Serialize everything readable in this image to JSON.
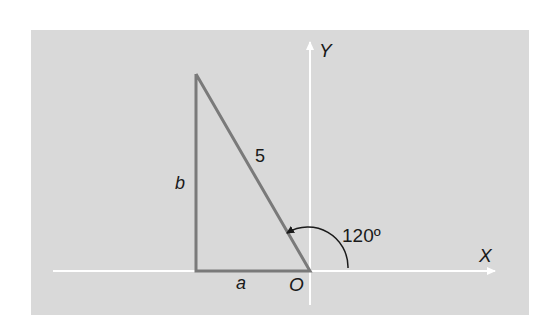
{
  "diagram": {
    "type": "right-triangle-on-axes",
    "colors": {
      "panel": "#d9d9d9",
      "axes": "#ffffff",
      "triangle": "#7a7a7a",
      "text": "#1a1a1a"
    },
    "axes": {
      "x_label": "X",
      "y_label": "Y",
      "origin_label": "O"
    },
    "triangle": {
      "hypotenuse_label": "5",
      "vertical_side_label": "b",
      "horizontal_side_label": "a"
    },
    "angle": {
      "label": "120º",
      "value_degrees": 120
    }
  }
}
